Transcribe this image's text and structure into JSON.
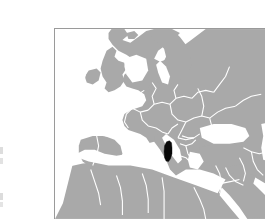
{
  "figure": {
    "type": "locator-map",
    "frame_border_color": "#9a9a9a",
    "background_color": "#ffffff"
  },
  "map": {
    "region": "Europe, North Africa and Western Asia",
    "projection_extent": {
      "west_longitude": -15,
      "east_longitude": 62,
      "south_latitude": 20,
      "north_latitude": 68
    },
    "colors": {
      "land": "#a9a9a9",
      "water": "#ffffff",
      "country_border": "#ffffff",
      "highlight": "#080808"
    },
    "highlighted_country": {
      "name": "Albania",
      "color": "#080808",
      "approx_pixel_center_x": 129,
      "approx_pixel_center_y": 136
    },
    "labels": [],
    "graticule": false,
    "legend": null,
    "scale_bar": null
  },
  "margin_marks": {
    "mark_1": "",
    "mark_2": "",
    "mark_3": "",
    "mark_4": ""
  }
}
